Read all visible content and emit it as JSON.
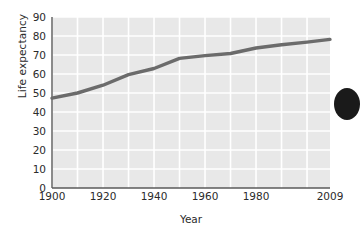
{
  "chart_data": {
    "type": "line",
    "title": "",
    "xlabel": "Year",
    "ylabel": "Life expectancy",
    "xlim": [
      1900,
      2009
    ],
    "ylim": [
      0,
      90
    ],
    "grid": true,
    "legend": null,
    "x_ticks": [
      "1900",
      "1920",
      "1940",
      "1960",
      "1980",
      "2009"
    ],
    "x_tick_values": [
      1900,
      1920,
      1940,
      1960,
      1980,
      2009
    ],
    "y_ticks": [
      "0",
      "10",
      "20",
      "30",
      "40",
      "50",
      "60",
      "70",
      "80",
      "90"
    ],
    "y_tick_values": [
      0,
      10,
      20,
      30,
      40,
      50,
      60,
      70,
      80,
      90
    ],
    "x": [
      1900,
      1910,
      1920,
      1930,
      1940,
      1950,
      1960,
      1970,
      1980,
      1990,
      2000,
      2009
    ],
    "values": [
      47.3,
      50.0,
      54.1,
      59.7,
      62.9,
      68.2,
      69.7,
      70.8,
      73.7,
      75.4,
      76.8,
      78.2
    ],
    "series": [
      {
        "name": "Life expectancy",
        "values": [
          47.3,
          50.0,
          54.1,
          59.7,
          62.9,
          68.2,
          69.7,
          70.8,
          73.7,
          75.4,
          76.8,
          78.2
        ]
      }
    ],
    "line_color": "#6b6b6b",
    "plot_bg_color": "#e8e8e8",
    "gridline_color": "#ffffff",
    "axis_color": "#5a5a5a"
  },
  "decoration": {
    "edge_dot_name": "page-bullet-dot"
  }
}
